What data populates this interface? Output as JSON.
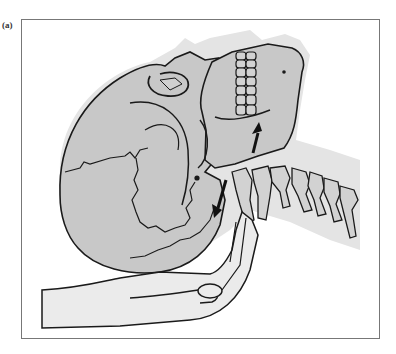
{
  "figure": {
    "panel_label": "(a)",
    "elements": {
      "skull": "skull-illustration",
      "mandible_arrow": "upward arrow on mandible",
      "occiput_arrow": "downward arrow near occiput",
      "spine": "cervical spine vertebrae",
      "hand": "supporting hand under occiput"
    },
    "colors": {
      "frame": "#777777",
      "outline": "#1a1a1a",
      "skull_fill": "#c8c8c8",
      "halo_fill": "#e4e4e4",
      "hand_fill": "#ebebeb",
      "arrow": "#111111"
    }
  }
}
